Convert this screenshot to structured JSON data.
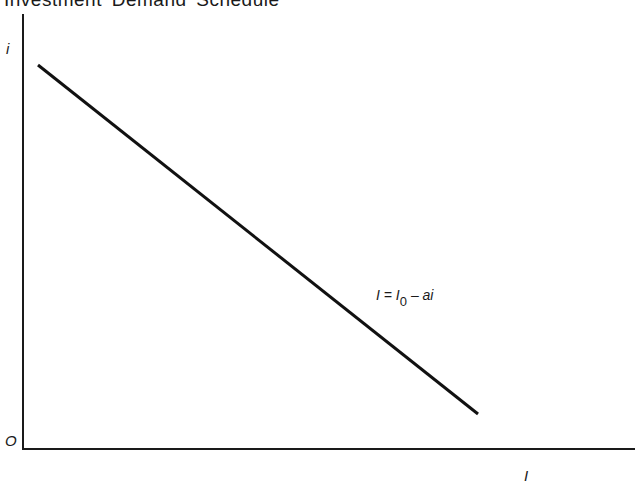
{
  "chart_data": {
    "type": "line",
    "title": "Investment Demand Schedule",
    "xlabel": "I",
    "ylabel": "i",
    "origin_label": "O",
    "grid": false,
    "legend": null,
    "ticks": false,
    "series": [
      {
        "name": "Investment demand",
        "equation": "I = I0 - ai",
        "points_px": [
          [
            38,
            65
          ],
          [
            478,
            414
          ]
        ],
        "description": "Downward-sloping straight line: investment I falls as interest rate i rises"
      }
    ],
    "annotations": [
      {
        "text_parts": {
          "lhs": "I",
          "eq": "=",
          "base": "I",
          "sub": "0",
          "rest": "– ai"
        },
        "position": "near middle-right of line"
      }
    ],
    "axes_px": {
      "origin": [
        23,
        449
      ],
      "y_top": 14,
      "x_right": 635
    }
  }
}
